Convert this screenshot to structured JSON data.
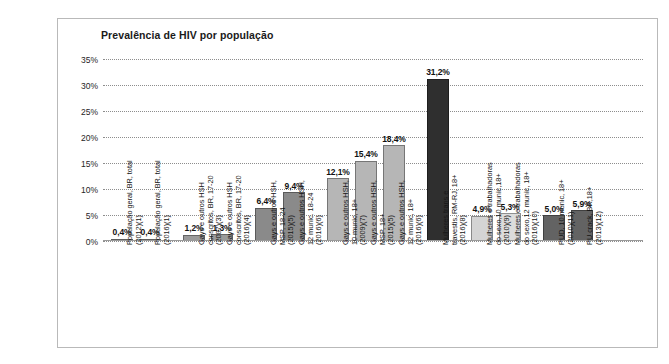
{
  "chart_data": {
    "type": "bar",
    "title": "Prevalência de HIV por população",
    "xlabel": "",
    "ylabel": "",
    "ylim": [
      0,
      35
    ],
    "grid": true,
    "legend": "none",
    "ytick_labels": [
      "35%",
      "30%",
      "25%",
      "20%",
      "15%",
      "10%",
      "5%",
      "0%"
    ],
    "ytick_values": [
      35,
      30,
      25,
      20,
      15,
      10,
      5,
      0
    ],
    "categories": [
      "População geral, BR, total\n(2012)(1)",
      "População geral, BR, total\n(2016)(1)",
      "Gays e outros HSH\nconscritos, BR, 17-20\n(2007)(3)",
      "Gays e outros HSH\nconscritos, BR, 17-20\n(2016)(4)",
      "Gays e outros HSH,\nMSP, 18-24\n(2015)(5)",
      "Gays e outros HSH,\n12 munic. 18-24\n(2016)(6)",
      "Gays e outros HSH,\n10 munic, 18+\n(2009)(7)",
      "Gays e outros HSH,\nMSP, 18+\n(2015)(5)",
      "Gays e outros HSH,\n12 munic, 18+\n(2016)(6)",
      "Mulheres trans e\ntravestis, RM-RJ, 18+\n(2016)(8)",
      "Mulheres e trabalhadoras\ndo sexo,10 munic,18+\n(2010)(9)",
      "Mulheres e trabalhadoras\ndo sexo,12 munic, 18+\n(2016)(10)",
      "PUD, 10 munic, 18+\n(2010)(11)",
      "PU crack, BR,18+\n(2013)(12)"
    ],
    "values": [
      0.4,
      0.4,
      1.2,
      1.3,
      6.4,
      9.4,
      12.1,
      15.4,
      18.4,
      31.2,
      4.9,
      5.3,
      5.0,
      5.9
    ],
    "value_labels": [
      "0,4%",
      "0,4%",
      "1,2%",
      "1,3%",
      "6,4%",
      "9,4%",
      "12,1%",
      "15,4%",
      "18,4%",
      "31,2%",
      "4,9%",
      "5,3%",
      "5,0%",
      "5,9%"
    ],
    "bar_colors": [
      "#8f8f8f",
      "#8f8f8f",
      "#9a9a9a",
      "#9a9a9a",
      "#8a8a8a",
      "#8a8a8a",
      "#b6b6b6",
      "#b6b6b6",
      "#b6b6b6",
      "#2f2f2f",
      "#d4d4d4",
      "#dcdcdc",
      "#636363",
      "#636363"
    ]
  },
  "caption": {
    "text": ""
  }
}
